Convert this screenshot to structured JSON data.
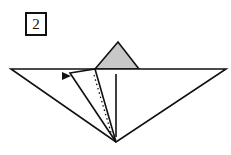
{
  "diagram": {
    "step_number": "2",
    "colors": {
      "line": "#111111",
      "flap_fill": "#c8c8c8",
      "background": "#ffffff"
    }
  }
}
